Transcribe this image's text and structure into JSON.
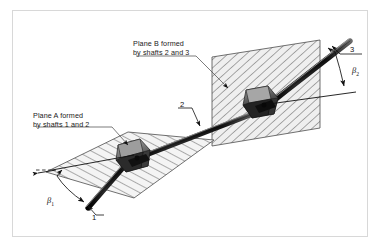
{
  "figure": {
    "type": "technical-diagram",
    "background_color": "#ffffff",
    "border_color": "#d8d8d8"
  },
  "labels": {
    "plane_a": {
      "line1": "Plane A formed",
      "line2": "by shafts 1 and 2"
    },
    "plane_b": {
      "line1": "Plane B formed",
      "line2": "by shafts 2 and 3"
    }
  },
  "callouts": {
    "shaft1": "1",
    "shaft2": "2",
    "shaft3": "3"
  },
  "angles": {
    "beta1": {
      "symbol": "β",
      "subscript": "1"
    },
    "beta2": {
      "symbol": "β",
      "subscript": "2"
    }
  },
  "planes": {
    "a": {
      "name": "Plane A",
      "fill": "#f2f2f2",
      "hatch": "#3a3a3a",
      "stroke": "#4d4d4d"
    },
    "b": {
      "name": "Plane B",
      "fill": "#efefef",
      "hatch": "#3a3a3a",
      "stroke": "#4d4d4d"
    }
  },
  "shafts": {
    "shaft1": {
      "id": "1",
      "color": "#151515"
    },
    "shaft2": {
      "id": "2",
      "color": "#151515"
    },
    "shaft3": {
      "id": "3",
      "color": "#151515"
    }
  },
  "joints": {
    "left": {
      "name": "universal-joint-left",
      "color": "#5e5e5e"
    },
    "right": {
      "name": "universal-joint-right",
      "color": "#5e5e5e"
    }
  }
}
